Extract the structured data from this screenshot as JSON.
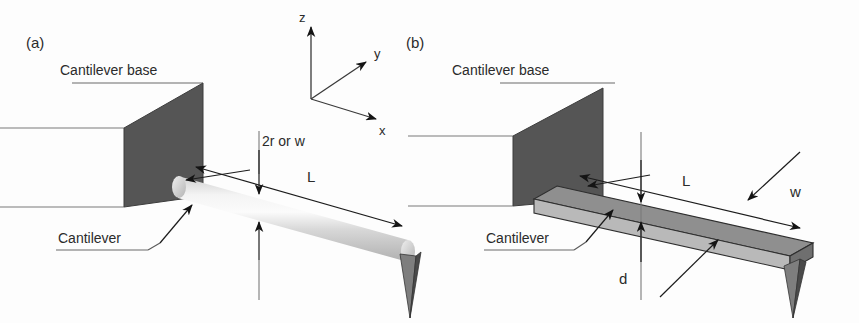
{
  "figure": {
    "title_visible": false,
    "background_color": "#fdfdfd",
    "panels": [
      {
        "id": "a",
        "label": "(a)",
        "cantilever_shape": "cylindrical",
        "annotations": {
          "base_label": "Cantilever base",
          "cantilever_label": "Cantilever",
          "length_label": "L",
          "cross_section_label": "2r or w"
        }
      },
      {
        "id": "b",
        "label": "(b)",
        "cantilever_shape": "rectangular-beam",
        "annotations": {
          "base_label": "Cantilever base",
          "cantilever_label": "Cantilever",
          "length_label": "L",
          "width_label": "w",
          "thickness_label": "d"
        }
      }
    ],
    "axes": {
      "z_label": "z",
      "y_label": "y",
      "x_label": "x"
    },
    "colors": {
      "base_face": "#555555",
      "beam_top": "#8f8f8f",
      "beam_side": "#b9b9b9",
      "cylinder_light": "#e8e8e8",
      "cylinder_mid": "#c4c4c4",
      "tip": "#4a4a4a",
      "text": "#2b2b2b",
      "arrow": "#141414"
    }
  }
}
